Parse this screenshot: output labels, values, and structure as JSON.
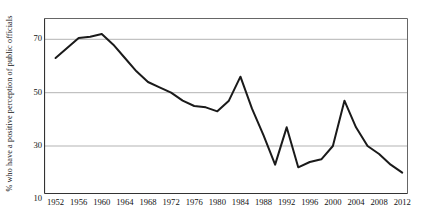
{
  "chart_data": {
    "type": "line",
    "title": "",
    "xlabel": "",
    "ylabel": "% who have a positive perception of public officials",
    "x": [
      1952,
      1956,
      1958,
      1960,
      1962,
      1964,
      1966,
      1968,
      1970,
      1972,
      1974,
      1976,
      1978,
      1980,
      1982,
      1984,
      1986,
      1988,
      1990,
      1992,
      1994,
      1996,
      1998,
      2000,
      2002,
      2004,
      2006,
      2008,
      2010,
      2012
    ],
    "values": [
      63,
      70.5,
      71,
      72,
      68,
      63,
      58,
      54,
      52,
      50,
      47,
      45,
      44.5,
      43,
      47,
      56,
      44,
      34,
      23,
      37,
      22,
      24,
      25,
      30,
      47,
      37,
      30,
      27,
      23,
      20
    ],
    "series": [
      {
        "name": "Positive perception of public officials",
        "values": [
          63,
          70.5,
          71,
          72,
          68,
          63,
          58,
          54,
          52,
          50,
          47,
          45,
          44.5,
          43,
          47,
          56,
          44,
          34,
          23,
          37,
          22,
          24,
          25,
          30,
          47,
          37,
          30,
          27,
          23,
          20
        ]
      }
    ],
    "ylim": [
      12,
      78
    ],
    "xlim": [
      1950,
      2013
    ],
    "yticks": [
      10,
      30,
      50,
      70
    ],
    "ytick_labels": [
      "10",
      "30",
      "50",
      "70"
    ],
    "xticks": [
      1952,
      1956,
      1960,
      1964,
      1968,
      1972,
      1976,
      1980,
      1984,
      1988,
      1992,
      1996,
      2000,
      2004,
      2008,
      2012
    ],
    "xtick_labels": [
      "1952",
      "1956",
      "1960",
      "1964",
      "1968",
      "1972",
      "1976",
      "1980",
      "1984",
      "1988",
      "1992",
      "1996",
      "2000",
      "2004",
      "2008",
      "2012"
    ],
    "grid": "horizontal",
    "legend": "none",
    "line_color": "#1a1a1a",
    "grid_color": "#b3b3b3",
    "axis_color": "#555555",
    "background_color": "#ffffff"
  }
}
